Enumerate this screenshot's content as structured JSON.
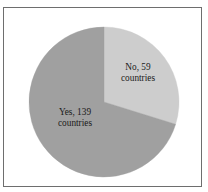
{
  "figure": {
    "title_clipped": true,
    "frame_color": "#6e6e6e",
    "background": "#ffffff"
  },
  "chart_data": {
    "type": "pie",
    "xlabel": "",
    "ylabel": "",
    "categories": [
      "No",
      "Yes"
    ],
    "values": [
      59,
      139
    ],
    "total": 198,
    "legend_position": "none",
    "grid": false,
    "labels_inside": true,
    "start_angle_deg": 0,
    "direction": "clockwise",
    "slices": [
      {
        "name": "No",
        "value": 59,
        "unit": "countries",
        "label_line1": "No, 59",
        "label_line2": "countries",
        "percent": 29.8,
        "angle_deg": 107.3,
        "color": "#cdcdcd"
      },
      {
        "name": "Yes",
        "value": 139,
        "unit": "countries",
        "label_line1": "Yes, 139",
        "label_line2": "countries",
        "percent": 70.2,
        "angle_deg": 252.7,
        "color": "#a0a0a0"
      }
    ]
  }
}
